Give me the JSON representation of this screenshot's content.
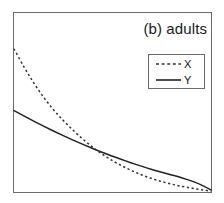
{
  "figure": {
    "panel_label": "(b) adults",
    "background_color": "#ffffff",
    "frame_color": "#6b6b6b"
  },
  "legend": {
    "position": "top-right",
    "border_color": "#6b6b6b",
    "entries": [
      {
        "label": "X",
        "style": "dashed",
        "color": "#333333"
      },
      {
        "label": "Y",
        "style": "solid",
        "color": "#222222"
      }
    ]
  },
  "chart_data": {
    "type": "line",
    "title": "(b) adults",
    "subtitle": "",
    "xlabel": "",
    "ylabel": "",
    "xlim": [
      0,
      1
    ],
    "ylim": [
      0,
      1
    ],
    "grid": false,
    "xticklabels": [],
    "yticklabels": [],
    "legend_position": "top-right",
    "annotations": [
      "(b) adults"
    ],
    "x": [
      0,
      0.05,
      0.1,
      0.15,
      0.2,
      0.25,
      0.3,
      0.35,
      0.4,
      0.45,
      0.5,
      0.55,
      0.6,
      0.65,
      0.7,
      0.75,
      0.8,
      0.85,
      0.9,
      0.95,
      1
    ],
    "series": [
      {
        "name": "X",
        "style": "dashed",
        "color": "#333333",
        "values": [
          0.8,
          0.7,
          0.61,
          0.53,
          0.46,
          0.4,
          0.345,
          0.295,
          0.25,
          0.21,
          0.175,
          0.145,
          0.118,
          0.095,
          0.075,
          0.058,
          0.044,
          0.032,
          0.022,
          0.013,
          0.005
        ]
      },
      {
        "name": "Y",
        "style": "solid",
        "color": "#222222",
        "values": [
          0.455,
          0.425,
          0.396,
          0.368,
          0.341,
          0.315,
          0.29,
          0.266,
          0.243,
          0.221,
          0.2,
          0.18,
          0.161,
          0.143,
          0.126,
          0.11,
          0.095,
          0.08,
          0.062,
          0.04,
          0.012
        ]
      }
    ]
  }
}
